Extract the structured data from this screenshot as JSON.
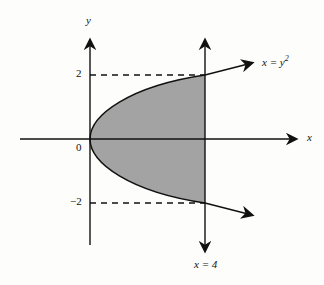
{
  "diagram": {
    "axes": {
      "x_label": "x",
      "y_label": "y",
      "origin_label": "0"
    },
    "y_ticks": [
      {
        "value": 2,
        "label": "2"
      },
      {
        "value": -2,
        "label": "−2"
      }
    ],
    "curves": [
      {
        "name": "parabola",
        "equation_lhs": "x = y",
        "equation_exp": "2"
      },
      {
        "name": "vertical-line",
        "equation": "x = 4"
      }
    ],
    "shaded_region": {
      "description": "area between x = y^2 and x = 4",
      "fill": "#a3a3a3"
    },
    "colors": {
      "stroke": "#111111",
      "background": "#fdfdfb",
      "shade": "#a3a3a3"
    }
  }
}
